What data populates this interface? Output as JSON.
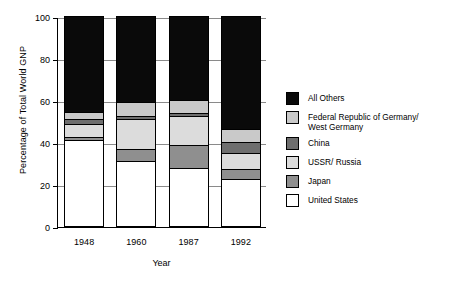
{
  "chart_data": {
    "type": "bar",
    "subtype": "stacked-bar",
    "title": "",
    "xlabel": "Year",
    "ylabel": "Percentage of Total World GNP",
    "categories": [
      "1948",
      "1960",
      "1987",
      "1992"
    ],
    "ylim": [
      0,
      100
    ],
    "yticks": [
      0,
      20,
      40,
      60,
      80,
      100
    ],
    "ytick_labels": [
      "0",
      "20",
      "40",
      "60",
      "80",
      "100"
    ],
    "grid": true,
    "grid_axis": "y",
    "legend_position": "right",
    "stack_order_bottom_to_top": [
      "United States",
      "Japan",
      "USSR/ Russia",
      "China",
      "Federal Republic of Germany/\nWest Germany",
      "All Others"
    ],
    "series": [
      {
        "name": "All Others",
        "color": "#0a0a0a",
        "values": [
          45.5,
          41.0,
          40.0,
          54.0
        ]
      },
      {
        "name": "Federal Republic of Germany/\nWest Germany",
        "color": "#c9c9c9",
        "values": [
          3.5,
          6.5,
          6.0,
          6.0
        ]
      },
      {
        "name": "China",
        "color": "#6e6e6e",
        "values": [
          2.5,
          1.5,
          1.5,
          5.0
        ]
      },
      {
        "name": "USSR/ Russia",
        "color": "#dcdcdc",
        "values": [
          6.0,
          14.5,
          14.0,
          8.0
        ]
      },
      {
        "name": "Japan",
        "color": "#8f8f8f",
        "values": [
          1.5,
          5.5,
          11.0,
          4.5
        ]
      },
      {
        "name": "United States",
        "color": "#ffffff",
        "values": [
          41.0,
          31.0,
          27.5,
          22.5
        ]
      }
    ],
    "cumulative_tops": {
      "1948": {
        "United States": 41.0,
        "Japan": 42.5,
        "USSR/ Russia": 48.5,
        "China": 51.0,
        "Federal Republic of Germany/ West Germany": 54.5,
        "All Others": 100
      },
      "1960": {
        "United States": 31.0,
        "Japan": 36.5,
        "USSR/ Russia": 51.0,
        "China": 52.5,
        "Federal Republic of Germany/ West Germany": 59.0,
        "All Others": 100
      },
      "1987": {
        "United States": 27.5,
        "Japan": 38.5,
        "USSR/ Russia": 52.5,
        "China": 54.0,
        "Federal Republic of Germany/ West Germany": 60.0,
        "All Others": 100
      },
      "1992": {
        "United States": 22.5,
        "Japan": 27.0,
        "USSR/ Russia": 35.0,
        "China": 40.0,
        "Federal Republic of Germany/ West Germany": 46.0,
        "All Others": 100
      }
    }
  },
  "legend": {
    "items": [
      {
        "label": "All Others",
        "color": "#0a0a0a"
      },
      {
        "label": "Federal Republic of Germany/\nWest Germany",
        "color": "#c9c9c9"
      },
      {
        "label": "China",
        "color": "#6e6e6e"
      },
      {
        "label": "USSR/ Russia",
        "color": "#dcdcdc"
      },
      {
        "label": "Japan",
        "color": "#8f8f8f"
      },
      {
        "label": "United States",
        "color": "#ffffff"
      }
    ]
  }
}
